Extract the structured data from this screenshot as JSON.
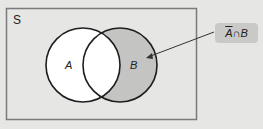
{
  "diagram": {
    "type": "venn",
    "universe_label": "S",
    "sets": [
      {
        "label": "A",
        "fill": "#ffffff"
      },
      {
        "label": "B",
        "fill": "#c4c4c2"
      }
    ],
    "shaded_region": {
      "complement_part": "A",
      "op": "∩",
      "rest": "B"
    },
    "colors": {
      "background": "#e6e6e4",
      "universe_border": "#7a7a7a",
      "circle_stroke": "#1e1e1e",
      "shaded": "#c4c4c2",
      "label_box": "#c9c9c7"
    }
  }
}
